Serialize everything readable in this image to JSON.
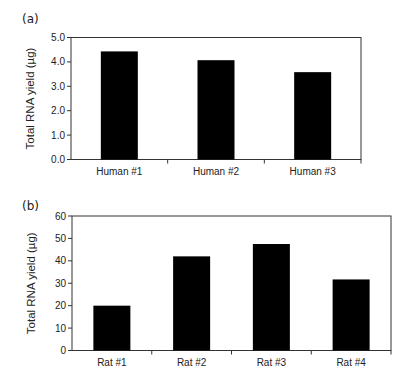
{
  "panels": {
    "a": {
      "label": "(a)"
    },
    "b": {
      "label": "(b)"
    }
  },
  "chart_data": [
    {
      "type": "bar",
      "panel": "(a)",
      "title": "",
      "xlabel": "",
      "ylabel": "Total RNA yield (µg)",
      "categories": [
        "Human #1",
        "Human #2",
        "Human #3"
      ],
      "values": [
        4.43,
        4.07,
        3.58
      ],
      "ylim": [
        0,
        5
      ],
      "yticks": [
        0,
        1,
        2,
        3,
        4,
        5
      ],
      "ytick_labels": [
        "0.0",
        "1.0",
        "2.0",
        "3.0",
        "4.0",
        "5.0"
      ],
      "grid": false,
      "legend": null,
      "bar_color": "#000000"
    },
    {
      "type": "bar",
      "panel": "(b)",
      "title": "",
      "xlabel": "",
      "ylabel": "Total RNA yield (µg)",
      "categories": [
        "Rat #1",
        "Rat #2",
        "Rat #3",
        "Rat #4"
      ],
      "values": [
        20,
        42,
        47.5,
        31.7
      ],
      "ylim": [
        0,
        60
      ],
      "yticks": [
        0,
        10,
        20,
        30,
        40,
        50,
        60
      ],
      "ytick_labels": [
        "0",
        "10",
        "20",
        "30",
        "40",
        "50",
        "60"
      ],
      "grid": false,
      "legend": null,
      "bar_color": "#000000"
    }
  ]
}
